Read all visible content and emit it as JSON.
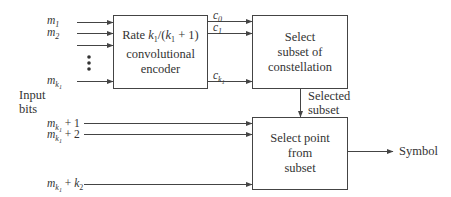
{
  "blocks": {
    "encoder": {
      "line1_prefix": "Rate ",
      "line1_formula": "k1/(k1 + 1)",
      "line2": "convolutional",
      "line3": "encoder"
    },
    "subset_selector": {
      "line1": "Select",
      "line2": "subset of",
      "line3": "constellation"
    },
    "point_selector": {
      "line1": "Select point",
      "line2": "from",
      "line3": "subset"
    }
  },
  "inputs_upper": [
    {
      "var": "m",
      "sub": "1"
    },
    {
      "var": "m",
      "sub": "2"
    },
    {
      "var": "m",
      "sub": "k1"
    }
  ],
  "inputs_lower": [
    {
      "var": "m",
      "sub": "k1",
      "suffix": " + 1"
    },
    {
      "var": "m",
      "sub": "k1",
      "suffix": " + 2"
    },
    {
      "var": "m",
      "sub": "k1",
      "suffix": " + k2"
    }
  ],
  "encoder_outputs": [
    {
      "var": "c",
      "sub": "0"
    },
    {
      "var": "c",
      "sub": "1"
    },
    {
      "var": "c",
      "sub": "k1"
    }
  ],
  "labels": {
    "input_bits_line1": "Input",
    "input_bits_line2": "bits",
    "selected_subset_line1": "Selected",
    "selected_subset_line2": "subset",
    "output": "Symbol"
  },
  "colors": {
    "line": "#444444",
    "text": "#333333",
    "background": "#ffffff"
  }
}
